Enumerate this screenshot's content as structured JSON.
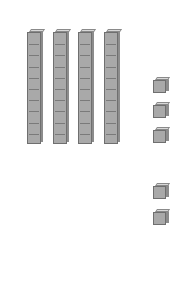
{
  "diagram": {
    "title": "",
    "rods": [
      {
        "label": "ten-rod",
        "units": 10,
        "x": 27,
        "y": 29,
        "height": 115
      },
      {
        "label": "ten-rod",
        "units": 10,
        "x": 53,
        "y": 29,
        "height": 115
      },
      {
        "label": "ten-rod",
        "units": 10,
        "x": 78,
        "y": 29,
        "height": 115
      },
      {
        "label": "ten-rod",
        "units": 10,
        "x": 104,
        "y": 29,
        "height": 115
      }
    ],
    "units": [
      {
        "label": "unit-cube",
        "x": 153,
        "y": 77
      },
      {
        "label": "unit-cube",
        "x": 153,
        "y": 102
      },
      {
        "label": "unit-cube",
        "x": 153,
        "y": 127
      },
      {
        "label": "unit-cube",
        "x": 153,
        "y": 183
      },
      {
        "label": "unit-cube",
        "x": 153,
        "y": 209
      }
    ],
    "colors": {
      "block_face": "#a9a9a9",
      "block_side": "#8c8c8c",
      "block_top": "#d8d8d8",
      "outline": "#6f6f6f",
      "background": "#ffffff"
    },
    "value": {
      "tens": 4,
      "ones": 5,
      "total": 45
    }
  }
}
